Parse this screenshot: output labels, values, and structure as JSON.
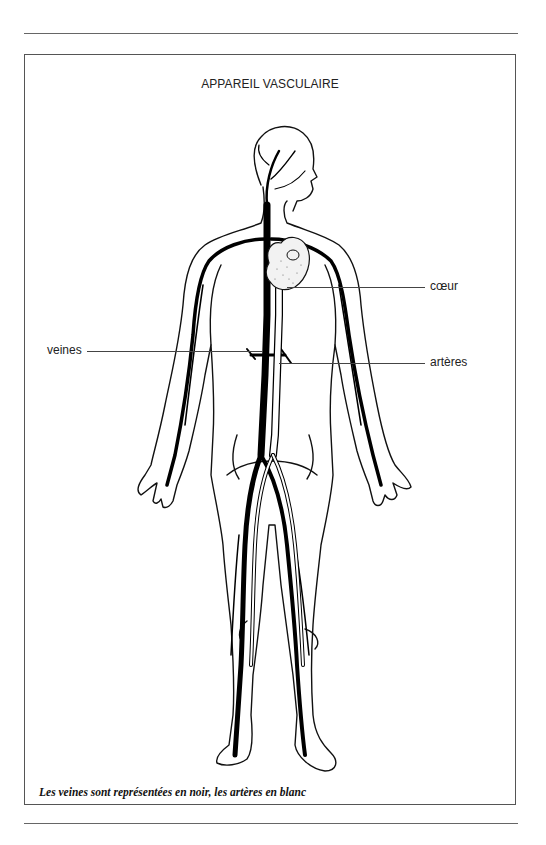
{
  "diagram": {
    "title": "APPAREIL VASCULAIRE",
    "labels": [
      {
        "id": "coeur",
        "text": "cœur",
        "target": "heart"
      },
      {
        "id": "veines",
        "text": "veines",
        "target": "veins"
      },
      {
        "id": "arteres",
        "text": "artères",
        "target": "arteries"
      }
    ],
    "caption": "Les veines sont représentées en noir, les artères en blanc",
    "legend": {
      "veins_color": "#000000",
      "arteries_color": "#ffffff"
    }
  }
}
